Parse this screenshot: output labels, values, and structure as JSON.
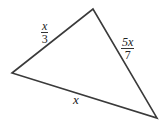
{
  "diagram": {
    "type": "triangle",
    "vertices": [
      [
        12,
        73
      ],
      [
        93,
        9
      ],
      [
        157,
        118
      ]
    ],
    "stroke_color": "#3a3a3a",
    "sides": [
      {
        "name": "left-upper",
        "label_num": "x",
        "label_den": "3"
      },
      {
        "name": "right",
        "label_num": "5x",
        "label_den": "7"
      },
      {
        "name": "bottom",
        "label": "x"
      }
    ]
  }
}
